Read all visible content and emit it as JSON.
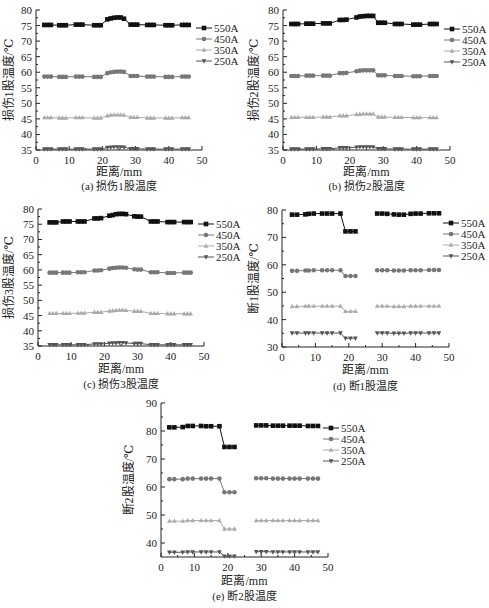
{
  "chart_data": [
    {
      "id": "a",
      "type": "line",
      "caption": "(a) 损伤1股温度",
      "xlabel": "距离/mm",
      "ylabel": "损伤1股温度/℃",
      "xlim": [
        0,
        50
      ],
      "ylim": [
        35,
        80
      ],
      "xticks": [
        0,
        10,
        20,
        30,
        40,
        50
      ],
      "yticks": [
        35,
        40,
        45,
        50,
        55,
        60,
        65,
        70,
        75,
        80
      ],
      "legend_position": "right",
      "x": [
        2.5,
        3.5,
        4.5,
        7,
        8,
        9,
        12,
        13,
        14,
        17.5,
        18.5,
        19.5,
        21.5,
        22.5,
        23.5,
        24.5,
        25.5,
        26.5,
        28.5,
        29.5,
        30.5,
        33.5,
        34.5,
        35.5,
        39,
        40,
        41,
        44,
        45,
        46
      ],
      "series": [
        {
          "name": "550A",
          "marker": "square",
          "color": "#111111",
          "values": [
            75.2,
            75.2,
            75.2,
            75.1,
            75.1,
            75.1,
            75.3,
            75.3,
            75.3,
            75.1,
            75.1,
            75.1,
            77.0,
            77.3,
            77.5,
            77.6,
            77.6,
            77.2,
            75.3,
            75.3,
            75.3,
            75.2,
            75.2,
            75.2,
            75.1,
            75.1,
            75.1,
            75.2,
            75.2,
            75.2
          ]
        },
        {
          "name": "450A",
          "marker": "circle",
          "color": "#777777",
          "values": [
            58.6,
            58.6,
            58.6,
            58.5,
            58.5,
            58.5,
            58.6,
            58.6,
            58.6,
            58.5,
            58.5,
            58.5,
            59.7,
            60.0,
            60.1,
            60.2,
            60.2,
            60.1,
            58.8,
            58.8,
            58.8,
            58.6,
            58.6,
            58.6,
            58.5,
            58.5,
            58.5,
            58.6,
            58.6,
            58.6
          ]
        },
        {
          "name": "350A",
          "marker": "triangle-up",
          "color": "#aaaaaa",
          "values": [
            45.4,
            45.4,
            45.4,
            45.3,
            45.3,
            45.3,
            45.4,
            45.4,
            45.4,
            45.3,
            45.3,
            45.3,
            46.0,
            46.2,
            46.3,
            46.3,
            46.3,
            46.2,
            45.5,
            45.5,
            45.5,
            45.3,
            45.3,
            45.3,
            45.3,
            45.3,
            45.3,
            45.4,
            45.4,
            45.4
          ]
        },
        {
          "name": "250A",
          "marker": "triangle-down",
          "color": "#555555",
          "values": [
            35.3,
            35.3,
            35.3,
            35.3,
            35.3,
            35.3,
            35.3,
            35.3,
            35.3,
            35.3,
            35.3,
            35.3,
            35.8,
            35.9,
            36.0,
            36.0,
            36.0,
            35.9,
            35.4,
            35.4,
            35.4,
            35.3,
            35.3,
            35.3,
            35.3,
            35.3,
            35.3,
            35.3,
            35.3,
            35.3
          ]
        }
      ]
    },
    {
      "id": "b",
      "type": "line",
      "caption": "(b) 损伤2股温度",
      "xlabel": "距离/mm",
      "ylabel": "损伤2股温度/℃",
      "xlim": [
        0,
        50
      ],
      "ylim": [
        35,
        80
      ],
      "xticks": [
        0,
        10,
        20,
        30,
        40,
        50
      ],
      "yticks": [
        35,
        40,
        45,
        50,
        55,
        60,
        65,
        70,
        75,
        80
      ],
      "legend_position": "right",
      "x": [
        2.5,
        3.5,
        4.5,
        7,
        8,
        9,
        12,
        13,
        14,
        17,
        18,
        19,
        22,
        23,
        24,
        25,
        26,
        27,
        28.5,
        29.5,
        30.5,
        33.5,
        34.5,
        35.5,
        39,
        40,
        41,
        44,
        45,
        46
      ],
      "series": [
        {
          "name": "550A",
          "marker": "square",
          "color": "#111111",
          "values": [
            75.5,
            75.5,
            75.5,
            75.6,
            75.6,
            75.6,
            75.7,
            75.7,
            75.7,
            76.8,
            76.8,
            76.9,
            77.6,
            77.9,
            78.0,
            78.1,
            78.1,
            78.1,
            75.9,
            75.9,
            75.9,
            75.5,
            75.5,
            75.5,
            75.3,
            75.3,
            75.3,
            75.5,
            75.5,
            75.5
          ]
        },
        {
          "name": "450A",
          "marker": "circle",
          "color": "#777777",
          "values": [
            58.8,
            58.8,
            58.8,
            58.9,
            58.9,
            58.9,
            58.9,
            58.9,
            58.9,
            59.7,
            59.7,
            59.8,
            60.3,
            60.5,
            60.6,
            60.6,
            60.6,
            60.6,
            59.0,
            59.0,
            59.0,
            58.8,
            58.8,
            58.8,
            58.7,
            58.7,
            58.7,
            58.8,
            58.8,
            58.8
          ]
        },
        {
          "name": "350A",
          "marker": "triangle-up",
          "color": "#aaaaaa",
          "values": [
            45.5,
            45.5,
            45.5,
            45.5,
            45.5,
            45.5,
            45.6,
            45.6,
            45.6,
            46.0,
            46.0,
            46.0,
            46.4,
            46.5,
            46.6,
            46.6,
            46.6,
            46.6,
            45.6,
            45.6,
            45.6,
            45.5,
            45.5,
            45.5,
            45.4,
            45.4,
            45.4,
            45.4,
            45.4,
            45.4
          ]
        },
        {
          "name": "250A",
          "marker": "triangle-down",
          "color": "#555555",
          "values": [
            35.3,
            35.3,
            35.3,
            35.3,
            35.3,
            35.3,
            35.4,
            35.4,
            35.4,
            35.7,
            35.7,
            35.7,
            35.9,
            36.0,
            36.0,
            36.0,
            36.0,
            36.0,
            35.4,
            35.4,
            35.4,
            35.3,
            35.3,
            35.3,
            35.3,
            35.3,
            35.3,
            35.3,
            35.3,
            35.3
          ]
        }
      ]
    },
    {
      "id": "c",
      "type": "line",
      "caption": "(c) 损伤3股温度",
      "xlabel": "距离/mm",
      "ylabel": "损伤3股温度/℃",
      "xlim": [
        0,
        50
      ],
      "ylim": [
        35,
        80
      ],
      "xticks": [
        0,
        10,
        20,
        30,
        40,
        50
      ],
      "yticks": [
        35,
        40,
        45,
        50,
        55,
        60,
        65,
        70,
        75,
        80
      ],
      "legend_position": "right",
      "x": [
        3.5,
        4.5,
        5.5,
        7.5,
        8.5,
        9.5,
        12,
        13,
        14,
        17,
        18,
        19,
        21.5,
        22.5,
        23.5,
        24.5,
        25.5,
        26.5,
        29,
        30,
        31,
        34,
        35,
        36,
        39,
        40,
        41,
        44,
        45,
        46
      ],
      "series": [
        {
          "name": "550A",
          "marker": "square",
          "color": "#111111",
          "values": [
            75.6,
            75.6,
            75.6,
            75.9,
            75.9,
            75.9,
            75.9,
            75.9,
            75.9,
            76.9,
            76.9,
            77.0,
            77.8,
            78.0,
            78.3,
            78.4,
            78.4,
            78.3,
            77.6,
            77.5,
            77.5,
            75.9,
            75.9,
            75.9,
            75.7,
            75.7,
            75.7,
            75.7,
            75.7,
            75.7
          ]
        },
        {
          "name": "450A",
          "marker": "circle",
          "color": "#777777",
          "values": [
            59.1,
            59.1,
            59.1,
            59.1,
            59.1,
            59.1,
            59.2,
            59.2,
            59.2,
            59.8,
            59.8,
            59.9,
            60.4,
            60.6,
            60.7,
            60.8,
            60.8,
            60.7,
            60.2,
            60.1,
            60.1,
            59.2,
            59.2,
            59.2,
            59.0,
            59.0,
            59.0,
            59.1,
            59.1,
            59.1
          ]
        },
        {
          "name": "350A",
          "marker": "triangle-up",
          "color": "#aaaaaa",
          "values": [
            45.7,
            45.7,
            45.7,
            45.7,
            45.7,
            45.7,
            45.8,
            45.8,
            45.8,
            46.1,
            46.1,
            46.1,
            46.5,
            46.6,
            46.7,
            46.8,
            46.8,
            46.7,
            46.4,
            46.4,
            46.4,
            45.7,
            45.7,
            45.7,
            45.6,
            45.6,
            45.6,
            45.6,
            45.6,
            45.6
          ]
        },
        {
          "name": "250A",
          "marker": "triangle-down",
          "color": "#555555",
          "values": [
            35.4,
            35.4,
            35.4,
            35.4,
            35.4,
            35.4,
            35.4,
            35.4,
            35.4,
            35.7,
            35.7,
            35.7,
            35.9,
            36.0,
            36.0,
            36.1,
            36.1,
            36.0,
            35.8,
            35.8,
            35.8,
            35.4,
            35.4,
            35.4,
            35.4,
            35.4,
            35.4,
            35.4,
            35.4,
            35.4
          ]
        }
      ]
    },
    {
      "id": "d",
      "type": "line",
      "caption": "(d) 断1股温度",
      "xlabel": "距离/mm",
      "ylabel": "断1股温度/℃",
      "xlim": [
        0,
        50
      ],
      "ylim": [
        30,
        80
      ],
      "xticks": [
        0,
        10,
        20,
        30,
        40,
        50
      ],
      "yticks": [
        30,
        40,
        50,
        60,
        70,
        80
      ],
      "legend_position": "right",
      "segments": [
        {
          "x": [
            3,
            4.5,
            7,
            8,
            9.5,
            12,
            13.5,
            15,
            17.5,
            19,
            20.5,
            22
          ]
        },
        {
          "x": [
            28.5,
            30,
            31.5,
            33.5,
            35,
            36.5,
            38.5,
            40,
            41.5,
            44,
            45.5,
            47
          ]
        }
      ],
      "series": [
        {
          "name": "550A",
          "marker": "square",
          "color": "#111111",
          "values": [
            [
              78.3,
              78.3,
              78.4,
              78.6,
              78.7,
              78.7,
              78.7,
              78.7,
              78.7,
              72.2,
              72.2,
              72.2
            ],
            [
              78.7,
              78.7,
              78.6,
              78.4,
              78.3,
              78.3,
              78.6,
              78.7,
              78.7,
              78.8,
              78.8,
              78.8
            ]
          ]
        },
        {
          "name": "450A",
          "marker": "circle",
          "color": "#777777",
          "values": [
            [
              57.8,
              57.8,
              57.9,
              57.9,
              58.0,
              58.0,
              58.0,
              58.0,
              58.0,
              55.9,
              55.9,
              55.9
            ],
            [
              58.0,
              58.0,
              58.0,
              57.9,
              57.9,
              57.9,
              58.0,
              58.0,
              58.0,
              58.1,
              58.1,
              58.1
            ]
          ]
        },
        {
          "name": "350A",
          "marker": "triangle-up",
          "color": "#aaaaaa",
          "values": [
            [
              44.8,
              44.8,
              44.9,
              44.9,
              44.9,
              44.9,
              44.9,
              44.9,
              44.9,
              43.0,
              43.0,
              43.0
            ],
            [
              44.9,
              44.9,
              44.9,
              44.8,
              44.8,
              44.8,
              44.9,
              44.9,
              44.9,
              44.9,
              44.9,
              44.9
            ]
          ]
        },
        {
          "name": "250A",
          "marker": "triangle-down",
          "color": "#555555",
          "values": [
            [
              35.1,
              35.1,
              35.1,
              35.1,
              35.1,
              35.1,
              35.1,
              35.1,
              35.1,
              33.2,
              33.2,
              33.2
            ],
            [
              35.1,
              35.1,
              35.1,
              35.0,
              35.0,
              35.0,
              35.1,
              35.1,
              35.1,
              35.1,
              35.1,
              35.1
            ]
          ]
        }
      ]
    },
    {
      "id": "e",
      "type": "line",
      "caption": "(e) 断2股温度",
      "xlabel": "距离/mm",
      "ylabel": "断2股温度/℃",
      "xlim": [
        0,
        50
      ],
      "ylim": [
        35,
        90
      ],
      "xticks": [
        0,
        10,
        20,
        30,
        40,
        50
      ],
      "yticks": [
        40,
        50,
        60,
        70,
        80,
        90
      ],
      "legend_position": "right",
      "segments": [
        {
          "x": [
            2.5,
            4,
            6.5,
            8,
            9.5,
            12,
            13.5,
            15,
            17.5,
            19,
            20.5,
            22
          ]
        },
        {
          "x": [
            28.5,
            30,
            31.5,
            33.5,
            35,
            36.5,
            38.5,
            40,
            41.5,
            44,
            45.5,
            47
          ]
        }
      ],
      "series": [
        {
          "name": "550A",
          "marker": "square",
          "color": "#111111",
          "values": [
            [
              81.3,
              81.3,
              81.4,
              81.8,
              81.8,
              81.8,
              81.7,
              81.7,
              81.7,
              74.3,
              74.3,
              74.3
            ],
            [
              82.0,
              82.0,
              82.0,
              81.9,
              81.9,
              81.9,
              81.9,
              81.9,
              81.9,
              81.8,
              81.8,
              81.8
            ]
          ]
        },
        {
          "name": "450A",
          "marker": "circle",
          "color": "#777777",
          "values": [
            [
              62.8,
              62.8,
              62.8,
              63.0,
              63.0,
              63.0,
              63.0,
              63.0,
              63.0,
              58.1,
              58.1,
              58.1
            ],
            [
              63.1,
              63.1,
              63.1,
              63.0,
              63.0,
              63.0,
              63.0,
              63.0,
              63.0,
              63.0,
              63.0,
              63.0
            ]
          ]
        },
        {
          "name": "350A",
          "marker": "triangle-up",
          "color": "#aaaaaa",
          "values": [
            [
              47.8,
              47.8,
              47.8,
              48.0,
              48.0,
              48.0,
              48.0,
              48.0,
              48.0,
              45.0,
              45.0,
              45.0
            ],
            [
              48.0,
              48.0,
              48.0,
              48.0,
              48.0,
              48.0,
              48.0,
              48.0,
              48.0,
              48.0,
              48.0,
              48.0
            ]
          ]
        },
        {
          "name": "250A",
          "marker": "triangle-down",
          "color": "#555555",
          "values": [
            [
              36.7,
              36.7,
              36.7,
              36.8,
              36.8,
              36.8,
              36.8,
              36.8,
              36.8,
              35.3,
              35.3,
              35.3
            ],
            [
              36.9,
              36.9,
              36.9,
              36.8,
              36.8,
              36.8,
              36.8,
              36.8,
              36.8,
              36.8,
              36.8,
              36.8
            ]
          ]
        }
      ]
    }
  ]
}
